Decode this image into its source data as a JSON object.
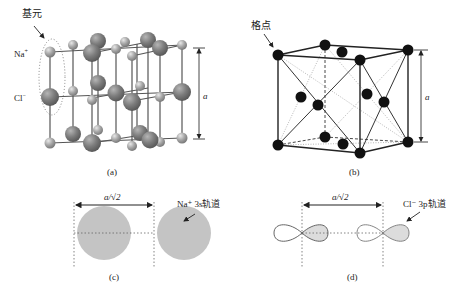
{
  "panels": {
    "a": {
      "caption": "(a)",
      "basis_label": "基元",
      "na_label": "Na",
      "na_sup": "+",
      "cl_label": "Cl",
      "cl_sup": "−",
      "dimension_label": "a",
      "colors": {
        "large_atom": "#7a7a7a",
        "small_atom": "#a8a8a8",
        "bond": "#555555"
      }
    },
    "b": {
      "caption": "(b)",
      "lattice_point_label": "格点",
      "dimension_label": "a",
      "colors": {
        "point": "#111111",
        "edge": "#222222"
      }
    },
    "c": {
      "caption": "(c)",
      "distance_label": "a/√2",
      "orbital_label": "Na⁺ 3s轨道",
      "colors": {
        "orbital": "#c4c4c4"
      }
    },
    "d": {
      "caption": "(d)",
      "distance_label": "a/√2",
      "orbital_label": "Cl⁻ 3p轨道",
      "colors": {
        "lobe_fill": "#dcdcdc",
        "lobe_stroke": "#555555"
      }
    }
  }
}
